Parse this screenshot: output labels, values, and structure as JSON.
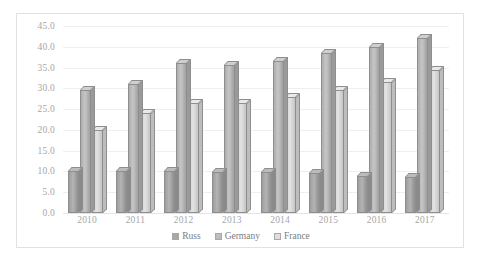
{
  "chart_data": {
    "type": "bar",
    "title": "",
    "xlabel": "",
    "ylabel": "",
    "categories": [
      "2010",
      "2011",
      "2012",
      "2013",
      "2014",
      "2015",
      "2016",
      "2017"
    ],
    "series": [
      {
        "name": "Russ",
        "color": "#a8a8a8",
        "values": [
          10.0,
          10.0,
          10.0,
          9.8,
          9.8,
          9.7,
          8.8,
          8.7
        ]
      },
      {
        "name": "Germany",
        "color": "#bdbdbd",
        "values": [
          29.5,
          31.0,
          36.0,
          35.5,
          36.5,
          38.5,
          40.0,
          42.0
        ]
      },
      {
        "name": "France",
        "color": "#dedede",
        "values": [
          20.0,
          24.0,
          26.5,
          26.5,
          28.0,
          29.5,
          31.5,
          34.5
        ]
      }
    ],
    "ylim": [
      0.0,
      45.0
    ],
    "ytick_step": 5.0,
    "yticks": [
      "45.0",
      "40.0",
      "35.0",
      "30.0",
      "25.0",
      "20.0",
      "15.0",
      "10.0",
      "5.0",
      "0.0"
    ],
    "grid": true,
    "legend_position": "bottom"
  }
}
